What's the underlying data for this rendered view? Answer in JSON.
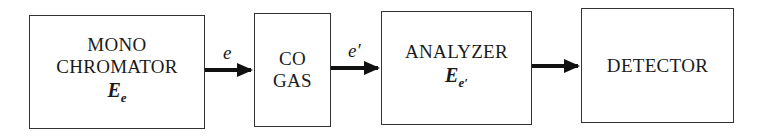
{
  "diagram": {
    "type": "block-flow",
    "blocks": [
      {
        "id": "monochromator",
        "lines": [
          "MONO",
          "CHROMATOR"
        ],
        "symbol": "E",
        "symbol_sub": "e"
      },
      {
        "id": "co-gas",
        "lines": [
          "CO",
          "GAS"
        ]
      },
      {
        "id": "analyzer",
        "lines": [
          "ANALYZER"
        ],
        "symbol": "E",
        "symbol_sub": "e′"
      },
      {
        "id": "detector",
        "lines": [
          "DETECTOR"
        ]
      }
    ],
    "arrows": [
      {
        "from": "monochromator",
        "to": "co-gas",
        "label": "e"
      },
      {
        "from": "co-gas",
        "to": "analyzer",
        "label": "e′"
      },
      {
        "from": "analyzer",
        "to": "detector",
        "label": ""
      }
    ]
  }
}
